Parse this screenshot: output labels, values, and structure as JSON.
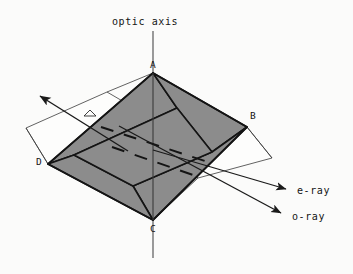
{
  "figure": {
    "title": "optic axis",
    "width": 353,
    "height": 274,
    "background": "#fbfbfa",
    "stroke_color": "#1a1a1a",
    "thin_stroke_color": "#3a3a3a",
    "shade_color": "#8c8c8c",
    "face_color": "#fdfdfc"
  },
  "labels": {
    "optic_axis": "optic axis",
    "vertex_a": "A",
    "vertex_b": "B",
    "vertex_c": "C",
    "vertex_d": "D",
    "e_ray": "e-ray",
    "o_ray": "o-ray"
  },
  "geometry": {
    "outer_rhombus": {
      "A": [
        153,
        73
      ],
      "B": [
        247,
        127
      ],
      "C": [
        153,
        220
      ],
      "D": [
        48,
        164
      ]
    },
    "inner_rhombus": {
      "top": [
        177,
        108
      ],
      "right": [
        212,
        152
      ],
      "bottom": [
        133,
        186
      ],
      "left": [
        74,
        155
      ]
    },
    "optic_axis_line": {
      "x": 153,
      "y_top": 31,
      "y_bottom": 258
    },
    "incident_ray": {
      "from": [
        126,
        150
      ],
      "to": [
        38,
        95
      ]
    },
    "e_ray": {
      "from": [
        153,
        150
      ],
      "to": [
        288,
        190
      ]
    },
    "o_ray": {
      "from": [
        120,
        127
      ],
      "to": [
        283,
        214
      ]
    },
    "left_plane": [
      [
        26,
        128
      ],
      [
        48,
        164
      ],
      [
        131,
        106
      ],
      [
        107,
        92
      ]
    ],
    "right_plane": [
      [
        247,
        127
      ],
      [
        272,
        158
      ],
      [
        198,
        178
      ],
      [
        176,
        152
      ]
    ],
    "dashes_count": 2
  },
  "icons": {
    "arrow_head": "arrowhead-icon",
    "right_angle": "right-angle-marker-icon"
  }
}
